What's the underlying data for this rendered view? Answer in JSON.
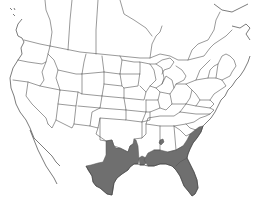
{
  "map": {
    "type": "species range map",
    "region": "North America (United States and southern Canada)",
    "projection": "conic, state/province outlines",
    "background_color": "#ffffff",
    "outline_color": "#555555",
    "range_color": "#6f6f6f",
    "range": {
      "description": "Shaded distribution across the US Gulf Coast and southeastern Atlantic coastal plain",
      "areas": [
        "Texas (central and eastern)",
        "Louisiana",
        "southern Mississippi",
        "southern Alabama",
        "Georgia coastal plain",
        "South Carolina coastal plain",
        "North Carolina coastal plain",
        "Florida",
        "isolated patch in northern Alabama"
      ]
    }
  }
}
